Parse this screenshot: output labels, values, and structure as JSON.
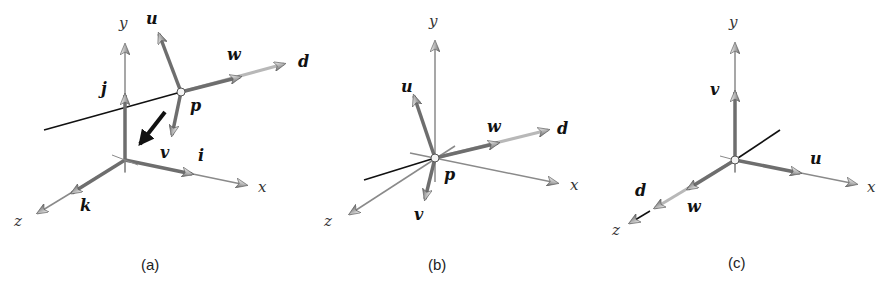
{
  "figure": {
    "panels": [
      {
        "id": "a",
        "caption": "(a)",
        "axis_labels": {
          "x": "x",
          "y": "y",
          "z": "z"
        },
        "world_basis_labels": {
          "i": "i",
          "j": "j",
          "k": "k"
        },
        "local_frame_labels": {
          "u": "u",
          "v": "v",
          "w": "w"
        },
        "point_label": "p",
        "direction_label": "d",
        "description": "Local frame (u,v,w) at point p with direction d, offset from world origin; black arrow indicates translation toward origin"
      },
      {
        "id": "b",
        "caption": "(b)",
        "axis_labels": {
          "x": "x",
          "y": "y",
          "z": "z"
        },
        "local_frame_labels": {
          "u": "u",
          "v": "v",
          "w": "w"
        },
        "point_label": "p",
        "direction_label": "d",
        "description": "Local frame translated so that p coincides with world origin"
      },
      {
        "id": "c",
        "caption": "(c)",
        "axis_labels": {
          "x": "x",
          "y": "y",
          "z": "z"
        },
        "local_frame_labels": {
          "u": "u",
          "v": "v",
          "w": "w"
        },
        "direction_label": "d",
        "description": "Local frame rotated to align u with x, v with y, w (and d) with z"
      }
    ]
  },
  "colors": {
    "axis_thin": "#8a8a8a",
    "vector_thick": "#6e6e6e",
    "direction_light": "#b8b8b8",
    "black_line": "#111111",
    "arrowhead_fill": "#c8c8c8",
    "arrowhead_stroke": "#555555"
  }
}
